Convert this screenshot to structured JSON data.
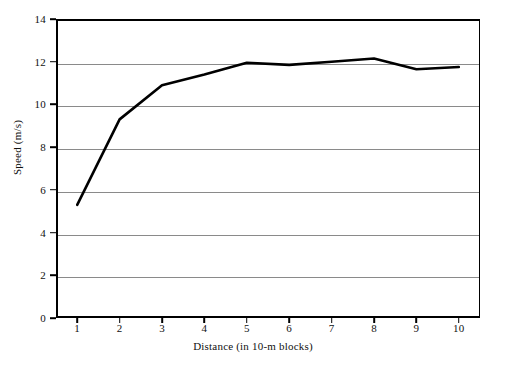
{
  "chart_data": {
    "type": "line",
    "title": "",
    "subtitle": "",
    "xlabel": "Distance (in 10-m blocks)",
    "ylabel": "Speed (m/s)",
    "x": [
      1,
      2,
      3,
      4,
      5,
      6,
      7,
      8,
      9,
      10
    ],
    "xticklabels": [
      "1",
      "2",
      "3",
      "4",
      "5",
      "6",
      "7",
      "8",
      "9",
      "10"
    ],
    "yticklabels": [
      "0",
      "2",
      "4",
      "6",
      "8",
      "10",
      "12",
      "14"
    ],
    "yticks": [
      0,
      2,
      4,
      6,
      8,
      10,
      12,
      14
    ],
    "xlim": [
      0.5,
      10.5
    ],
    "ylim": [
      0,
      14
    ],
    "grid": "horizontal",
    "legend": "none",
    "series": [
      {
        "name": "Speed",
        "color": "#000000",
        "linewidth": 2.6,
        "values": [
          5.3,
          9.3,
          10.9,
          11.4,
          11.95,
          11.85,
          12.0,
          12.15,
          11.65,
          11.75
        ]
      }
    ],
    "annotations": []
  },
  "figure": {
    "background": "#ffffff",
    "axis_color": "#000000",
    "grid_color": "#8a8a8a"
  }
}
